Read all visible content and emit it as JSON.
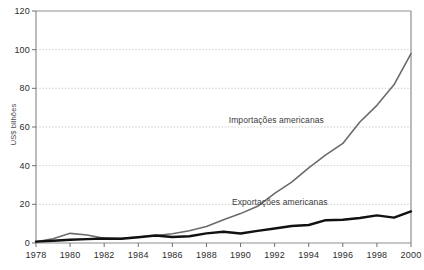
{
  "chart_data": {
    "type": "line",
    "title": "",
    "subtitle": "",
    "xlabel": "",
    "ylabel": "US$ bilhões",
    "xlim": [
      1978,
      2000
    ],
    "ylim": [
      0,
      120
    ],
    "grid": true,
    "grid_style": "horizontal dashed",
    "legend_position": "inline annotations on plot",
    "x": [
      1978,
      1979,
      1980,
      1981,
      1982,
      1983,
      1984,
      1985,
      1986,
      1987,
      1988,
      1989,
      1990,
      1991,
      1992,
      1993,
      1994,
      1995,
      1996,
      1997,
      1998,
      1999,
      2000
    ],
    "xtick_labels": [
      "1978",
      "1980",
      "1982",
      "1984",
      "1986",
      "1988",
      "1990",
      "1992",
      "1994",
      "1996",
      "1998",
      "2000"
    ],
    "xtick_values": [
      1978,
      1980,
      1982,
      1984,
      1986,
      1988,
      1990,
      1992,
      1994,
      1996,
      1998,
      2000
    ],
    "ytick_labels": [
      "0",
      "20",
      "40",
      "60",
      "80",
      "100",
      "120"
    ],
    "ytick_values": [
      0,
      20,
      40,
      60,
      80,
      100,
      120
    ],
    "series": [
      {
        "name": "Importações americanas",
        "color": "#6b6b6b",
        "width": 1.6,
        "label_x": 1992.1,
        "label_y": 63,
        "values": [
          0.6,
          2.2,
          5.0,
          4.1,
          2.4,
          2.3,
          3.1,
          3.9,
          4.8,
          6.3,
          8.5,
          12.0,
          15.2,
          19.0,
          25.7,
          31.5,
          38.8,
          45.6,
          51.5,
          62.6,
          71.2,
          81.8,
          98.0
        ]
      },
      {
        "name": "Exportações americanas",
        "color": "#111111",
        "width": 2.4,
        "label_x": 1992.3,
        "label_y": 20.5,
        "values": [
          0.7,
          1.2,
          1.7,
          2.0,
          2.3,
          2.2,
          3.0,
          3.9,
          3.1,
          3.5,
          5.0,
          5.8,
          4.9,
          6.3,
          7.5,
          8.8,
          9.3,
          11.8,
          12.0,
          12.9,
          14.3,
          13.1,
          16.3
        ]
      }
    ]
  },
  "axis": {
    "y_title": "US$ bilhões"
  }
}
